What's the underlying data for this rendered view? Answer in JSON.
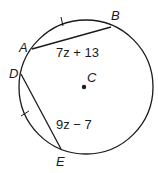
{
  "diagram": {
    "circle": {
      "center_label": "C"
    },
    "points": {
      "A": "A",
      "B": "B",
      "C": "C",
      "D": "D",
      "E": "E"
    },
    "chords": [
      {
        "name": "AB",
        "expression": "7z + 13"
      },
      {
        "name": "DE",
        "expression": "9z − 7"
      }
    ],
    "congruence_marks": [
      "arc AB tick",
      "arc DE tick"
    ],
    "colors": {
      "stroke": "#1a1a1a",
      "background": "#ffffff"
    }
  }
}
